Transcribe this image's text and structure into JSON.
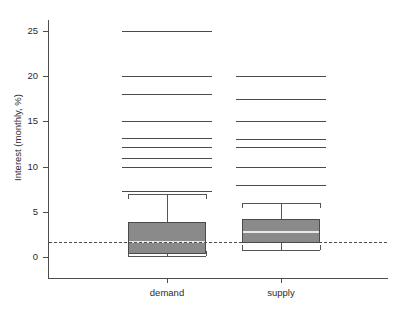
{
  "chart_data": {
    "type": "box",
    "title": "",
    "xlabel": "",
    "ylabel": "Interest (monthly, %)",
    "categories": [
      "demand",
      "supply"
    ],
    "ylim": [
      -0.8,
      27.5
    ],
    "yticks": [
      0,
      5,
      10,
      15,
      20,
      25
    ],
    "ytick_labels": [
      "0",
      "5",
      "10",
      "15",
      "20",
      "25"
    ],
    "grid": false,
    "legend": false,
    "reference_line": {
      "value": 1.7,
      "style": "dashed",
      "orientation": "horizontal",
      "color": "#4d4d4d"
    },
    "box_style": {
      "fill_color": "#8a8a8a",
      "edge_color": "#4a4a4a",
      "median_color": "#e8e8e8",
      "whisker_color": "#555555",
      "outlier_marker": "horizontal-line"
    },
    "boxes": [
      {
        "name": "demand",
        "whisker_low": 0.1,
        "q1": 0.3,
        "median": 1.8,
        "q3": 3.9,
        "whisker_high": 7.0,
        "outliers": [
          25.0,
          20.0,
          18.0,
          15.0,
          13.2,
          12.2,
          11.0,
          10.0,
          7.3
        ]
      },
      {
        "name": "supply",
        "whisker_low": 0.8,
        "q1": 1.6,
        "median": 2.9,
        "q3": 4.2,
        "whisker_high": 6.0,
        "outliers": [
          20.0,
          17.5,
          15.0,
          13.0,
          12.2,
          10.0,
          8.0
        ]
      }
    ]
  },
  "axis": {
    "y_label": "Interest (monthly, %)",
    "y_tick_labels": [
      "25",
      "20",
      "15",
      "10",
      "5",
      "0"
    ],
    "x_tick_labels": [
      "demand",
      "supply"
    ]
  },
  "colors": {
    "box_fill": "#8a8a8a",
    "box_edge": "#4a4a4a",
    "median": "#e8e8e8",
    "axis": "#4d4d4d",
    "text": "#2b2b2b",
    "background": "#ffffff"
  }
}
